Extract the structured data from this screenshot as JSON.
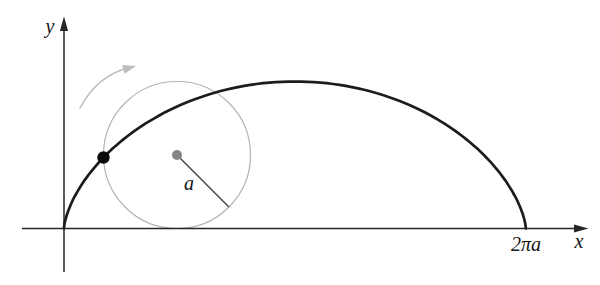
{
  "figure": {
    "labels": {
      "y_axis": "y",
      "x_axis": "x",
      "x_intercept": "2πa",
      "radius": "a"
    },
    "geometry": {
      "origin": [
        64,
        228.5
      ],
      "radius": 73.5,
      "roll_angle_current": 1.537,
      "roll_angle_max": 6.28318,
      "radius_line_angle_deg": 45,
      "center_dot_r": 5,
      "trace_dot_r": 6.2
    },
    "colors": {
      "background": "#ffffff",
      "curve": "#1c1c1c",
      "axis": "#262626",
      "circle": "#b4b4b4",
      "rotation_arrow": "#bcbcbc",
      "center_dot": "#868686",
      "trace_dot": "#0a0a0a",
      "radius_line": "#4a4a4a"
    }
  }
}
